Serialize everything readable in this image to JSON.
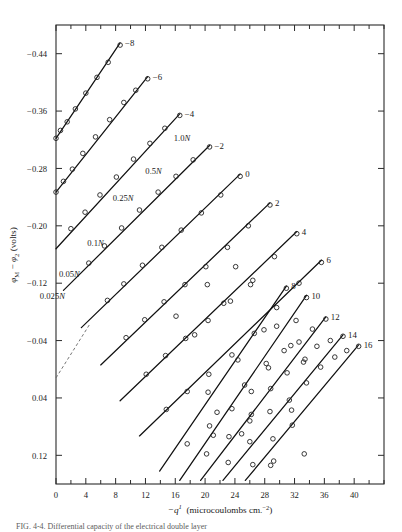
{
  "figure": {
    "type": "scientific-plot",
    "caption_partial": "FIG. 4-4. Differential capacity of the electrical double layer"
  },
  "chart_data": {
    "type": "line",
    "title": "",
    "xlabel": "−q_1  (microcoulombs cm.⁻²)",
    "ylabel": "φM − φ2  (volts)",
    "xlim": [
      0,
      44
    ],
    "ylim": [
      0.16,
      -0.48
    ],
    "xticks": [
      0,
      4,
      8,
      12,
      16,
      20,
      24,
      28,
      32,
      36,
      40
    ],
    "xtick_labels": [
      "0",
      "4",
      "8",
      "12",
      "16",
      "20",
      "24",
      "28",
      "32",
      "36",
      "40"
    ],
    "xminor_step": 2,
    "yticks": [
      -0.44,
      -0.36,
      -0.28,
      -0.2,
      -0.12,
      -0.04,
      0.04,
      0.12
    ],
    "ytick_labels": [
      "−0.44",
      "−0.36",
      "−0.28",
      "−0.20",
      "−0.12",
      "−0.04",
      "0.04",
      "0.12"
    ],
    "grid": false,
    "legend_position": "inline-end-labels",
    "marker": "open-circle",
    "concentration_labels": [
      {
        "text": "0.025N",
        "x": 1.2,
        "y": -0.098
      },
      {
        "text": "0.05N",
        "x": 3.2,
        "y": -0.128
      },
      {
        "text": "0.1N",
        "x": 6.4,
        "y": -0.172
      },
      {
        "text": "0.25N",
        "x": 10.4,
        "y": -0.235
      },
      {
        "text": "0.5N",
        "x": 14.2,
        "y": -0.272
      },
      {
        "text": "1.0N",
        "x": 18.0,
        "y": -0.318
      }
    ],
    "series": [
      {
        "name": "-8",
        "label": "−8",
        "line": [
          [
            0.0,
            -0.322
          ],
          [
            8.6,
            -0.455
          ]
        ],
        "points": [
          [
            0.0,
            -0.322
          ],
          [
            0.6,
            -0.333
          ],
          [
            1.5,
            -0.345
          ],
          [
            2.6,
            -0.363
          ],
          [
            4.0,
            -0.385
          ],
          [
            5.5,
            -0.407
          ],
          [
            7.0,
            -0.428
          ],
          [
            8.6,
            -0.452
          ]
        ]
      },
      {
        "name": "-6",
        "label": "−6",
        "line": [
          [
            0.0,
            -0.247
          ],
          [
            12.3,
            -0.408
          ]
        ],
        "points": [
          [
            0.0,
            -0.247
          ],
          [
            1.0,
            -0.262
          ],
          [
            2.2,
            -0.279
          ],
          [
            3.6,
            -0.301
          ],
          [
            5.3,
            -0.324
          ],
          [
            7.2,
            -0.348
          ],
          [
            9.1,
            -0.372
          ],
          [
            10.7,
            -0.389
          ],
          [
            12.3,
            -0.405
          ]
        ]
      },
      {
        "name": "-4",
        "label": "−4",
        "line": [
          [
            0.0,
            -0.168
          ],
          [
            16.6,
            -0.356
          ]
        ],
        "points": [
          [
            2.0,
            -0.196
          ],
          [
            3.9,
            -0.219
          ],
          [
            5.9,
            -0.243
          ],
          [
            8.1,
            -0.268
          ],
          [
            10.4,
            -0.293
          ],
          [
            12.6,
            -0.315
          ],
          [
            14.6,
            -0.336
          ],
          [
            16.6,
            -0.354
          ]
        ]
      },
      {
        "name": "-2",
        "label": "−2",
        "line": [
          [
            1.0,
            -0.11
          ],
          [
            20.6,
            -0.312
          ]
        ],
        "points": [
          [
            4.4,
            -0.148
          ],
          [
            6.5,
            -0.172
          ],
          [
            8.8,
            -0.197
          ],
          [
            11.2,
            -0.222
          ],
          [
            13.7,
            -0.247
          ],
          [
            16.1,
            -0.269
          ],
          [
            18.4,
            -0.292
          ],
          [
            20.6,
            -0.31
          ]
        ]
      },
      {
        "name": "0",
        "label": "0",
        "line": [
          [
            3.4,
            -0.058
          ],
          [
            24.7,
            -0.272
          ]
        ],
        "points": [
          [
            6.9,
            -0.096
          ],
          [
            9.1,
            -0.119
          ],
          [
            11.6,
            -0.145
          ],
          [
            14.2,
            -0.17
          ],
          [
            16.8,
            -0.194
          ],
          [
            19.5,
            -0.218
          ],
          [
            22.1,
            -0.243
          ],
          [
            24.7,
            -0.269
          ]
        ]
      },
      {
        "name": "2",
        "label": "2",
        "line": [
          [
            6.0,
            -0.006
          ],
          [
            28.7,
            -0.232
          ]
        ],
        "points": [
          [
            9.4,
            -0.044
          ],
          [
            11.9,
            -0.069
          ],
          [
            14.5,
            -0.094
          ],
          [
            17.3,
            -0.118
          ],
          [
            20.1,
            -0.143
          ],
          [
            23.0,
            -0.17
          ],
          [
            25.8,
            -0.2
          ],
          [
            28.7,
            -0.229
          ]
        ]
      },
      {
        "name": "4",
        "label": "4",
        "line": [
          [
            8.6,
            0.044
          ],
          [
            32.3,
            -0.192
          ]
        ],
        "points": [
          [
            12.1,
            0.007
          ],
          [
            14.7,
            -0.019
          ],
          [
            17.4,
            -0.043
          ],
          [
            20.4,
            -0.068
          ],
          [
            23.4,
            -0.095
          ],
          [
            26.4,
            -0.124
          ],
          [
            29.3,
            -0.157
          ],
          [
            32.3,
            -0.189
          ]
        ]
      },
      {
        "name": "6",
        "label": "6",
        "line": [
          [
            11.2,
            0.093
          ],
          [
            35.6,
            -0.152
          ]
        ],
        "points": [
          [
            14.8,
            0.056
          ],
          [
            17.6,
            0.031
          ],
          [
            20.5,
            0.007
          ],
          [
            23.6,
            -0.02
          ],
          [
            26.6,
            -0.05
          ],
          [
            29.6,
            -0.086
          ],
          [
            32.6,
            -0.12
          ],
          [
            35.6,
            -0.149
          ]
        ]
      },
      {
        "name": "8",
        "label": "8",
        "line": [
          [
            13.9,
            0.142
          ],
          [
            30.9,
            -0.116
          ]
        ],
        "points": [
          [
            17.6,
            0.104
          ],
          [
            20.6,
            0.079
          ],
          [
            23.6,
            0.055
          ],
          [
            26.2,
            0.031
          ],
          [
            28.2,
            -0.008
          ],
          [
            29.6,
            -0.06
          ],
          [
            30.9,
            -0.113
          ]
        ]
      },
      {
        "name": "10",
        "label": "10",
        "line": [
          [
            16.6,
            0.155
          ],
          [
            33.6,
            -0.103
          ]
        ],
        "points": [
          [
            20.2,
            0.118
          ],
          [
            23.2,
            0.094
          ],
          [
            26.2,
            0.063
          ],
          [
            28.8,
            0.027
          ],
          [
            30.6,
            -0.026
          ],
          [
            32.2,
            -0.068
          ],
          [
            33.6,
            -0.1
          ]
        ]
      },
      {
        "name": "12",
        "label": "12",
        "line": [
          [
            19.4,
            0.155
          ],
          [
            36.2,
            -0.073
          ]
        ],
        "points": [
          [
            23.1,
            0.13
          ],
          [
            26.0,
            0.101
          ],
          [
            28.7,
            0.059
          ],
          [
            31.0,
            0.005
          ],
          [
            32.6,
            -0.038
          ],
          [
            34.4,
            -0.056
          ],
          [
            36.2,
            -0.07
          ]
        ]
      },
      {
        "name": "14",
        "label": "14",
        "line": [
          [
            22.4,
            0.155
          ],
          [
            38.5,
            -0.048
          ]
        ],
        "points": [
          [
            26.4,
            0.133
          ],
          [
            29.1,
            0.097
          ],
          [
            31.3,
            0.043
          ],
          [
            33.2,
            -0.01
          ],
          [
            35.0,
            -0.032
          ],
          [
            36.8,
            -0.04
          ],
          [
            38.5,
            -0.046
          ]
        ]
      },
      {
        "name": "16",
        "label": "16",
        "line": [
          [
            25.4,
            0.155
          ],
          [
            40.6,
            -0.034
          ]
        ],
        "points": [
          [
            29.2,
            0.128
          ],
          [
            31.7,
            0.078
          ],
          [
            33.6,
            0.019
          ],
          [
            35.5,
            -0.003
          ],
          [
            37.4,
            -0.017
          ],
          [
            39.0,
            -0.026
          ],
          [
            40.6,
            -0.032
          ]
        ]
      }
    ],
    "scatter_extra": [
      [
        16.1,
        -0.074
      ],
      [
        18.6,
        -0.048
      ],
      [
        20.4,
        0.032
      ],
      [
        21.6,
        0.06
      ],
      [
        20.3,
        -0.118
      ],
      [
        22.5,
        -0.092
      ],
      [
        24.4,
        -0.013
      ],
      [
        25.3,
        0.022
      ],
      [
        24.1,
        -0.143
      ],
      [
        26.1,
        -0.118
      ],
      [
        27.9,
        -0.055
      ],
      [
        28.5,
        -0.002
      ],
      [
        21.1,
        0.092
      ],
      [
        24.9,
        0.09
      ],
      [
        26.0,
        0.072
      ],
      [
        28.8,
        0.134
      ],
      [
        31.6,
        0.057
      ],
      [
        33.3,
        0.118
      ],
      [
        31.5,
        -0.033
      ],
      [
        33.4,
        -0.014
      ]
    ],
    "dashed_branch": {
      "line": [
        [
          0.0,
          0.012
        ],
        [
          4.6,
          -0.064
        ]
      ]
    }
  }
}
